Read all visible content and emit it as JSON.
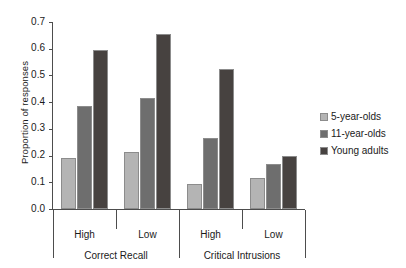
{
  "chart_data": {
    "type": "bar",
    "title": "",
    "subtitle": "",
    "xlabel": "",
    "ylabel": "Proportion of responses",
    "ylim": [
      0.0,
      0.7
    ],
    "yticks": [
      "0.0",
      "0.1",
      "0.2",
      "0.3",
      "0.4",
      "0.5",
      "0.6",
      "0.7"
    ],
    "ytick_values": [
      0.0,
      0.1,
      0.2,
      0.3,
      0.4,
      0.5,
      0.6,
      0.7
    ],
    "grid": false,
    "legend_position": "right",
    "categories": [
      "High",
      "Low",
      "High",
      "Low"
    ],
    "group_labels": [
      "Correct Recall",
      "Critical Intrusions"
    ],
    "groups": [
      {
        "super_label": "Correct Recall",
        "sub_labels": [
          "High",
          "Low"
        ]
      },
      {
        "super_label": "Critical Intrusions",
        "sub_labels": [
          "High",
          "Low"
        ]
      }
    ],
    "series": [
      {
        "name": "5-year-olds",
        "color": "#b4b4b4",
        "values": [
          0.19,
          0.215,
          0.095,
          0.115
        ]
      },
      {
        "name": "11-year-olds",
        "color": "#6e6e6e",
        "values": [
          0.385,
          0.415,
          0.265,
          0.17
        ]
      },
      {
        "name": "Young adults",
        "color": "#474240",
        "values": [
          0.595,
          0.655,
          0.525,
          0.2
        ]
      }
    ],
    "legend": [
      {
        "label": "5-year-olds",
        "color": "#b4b4b4"
      },
      {
        "label": "11-year-olds",
        "color": "#6e6e6e"
      },
      {
        "label": "Young adults",
        "color": "#474240"
      }
    ],
    "axis_color": "#4d4d4d",
    "background": "#ffffff"
  }
}
